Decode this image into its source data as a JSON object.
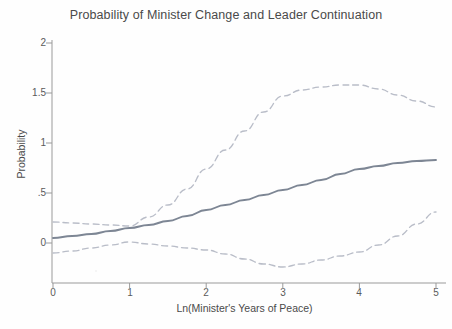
{
  "chart_data": {
    "type": "line",
    "title": "Probability of Minister Change and Leader Continuation",
    "xlabel": "Ln(Minister's Years of Peace)",
    "ylabel": "Probability",
    "xlim": [
      0,
      5
    ],
    "ylim": [
      -0.35,
      2
    ],
    "xticks": [
      "0",
      "1",
      "2",
      "3",
      "4",
      "5"
    ],
    "xtick_values": [
      0,
      1,
      2,
      3,
      4,
      5
    ],
    "yticks": [
      "0",
      ".5",
      "1",
      "1.5",
      "2"
    ],
    "ytick_values": [
      0,
      0.5,
      1,
      1.5,
      2
    ],
    "grid": false,
    "legend": "none",
    "x": [
      0,
      0.25,
      0.5,
      0.75,
      1,
      1.25,
      1.5,
      1.75,
      2,
      2.25,
      2.5,
      2.75,
      3,
      3.25,
      3.5,
      3.75,
      4,
      4.25,
      4.5,
      4.75,
      5
    ],
    "series": [
      {
        "name": "Predicted probability",
        "style": "solid",
        "color": "#7d8694",
        "values": [
          0.05,
          0.07,
          0.09,
          0.12,
          0.15,
          0.18,
          0.22,
          0.27,
          0.33,
          0.38,
          0.43,
          0.48,
          0.53,
          0.58,
          0.63,
          0.69,
          0.74,
          0.77,
          0.8,
          0.82,
          0.83
        ]
      },
      {
        "name": "Upper 95% confidence bound",
        "style": "dashed",
        "color": "#b9bdc8",
        "values": [
          0.21,
          0.2,
          0.19,
          0.18,
          0.17,
          0.26,
          0.38,
          0.54,
          0.74,
          0.93,
          1.12,
          1.31,
          1.47,
          1.53,
          1.56,
          1.58,
          1.58,
          1.54,
          1.48,
          1.42,
          1.36
        ]
      },
      {
        "name": "Lower 95% confidence bound",
        "style": "dashed",
        "color": "#b9bdc8",
        "values": [
          -0.1,
          -0.08,
          -0.05,
          -0.02,
          0.01,
          -0.01,
          -0.03,
          -0.05,
          -0.07,
          -0.11,
          -0.16,
          -0.21,
          -0.24,
          -0.21,
          -0.17,
          -0.13,
          -0.09,
          -0.02,
          0.07,
          0.19,
          0.31
        ]
      }
    ]
  }
}
